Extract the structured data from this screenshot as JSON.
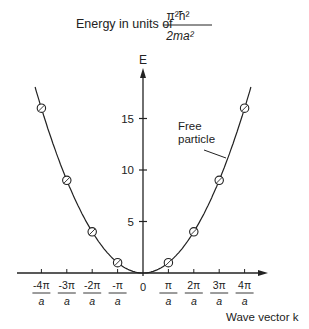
{
  "title": {
    "prefix": "Energy in units of",
    "numerator": "π²ħ²",
    "denominator": "2ma²"
  },
  "axes": {
    "y_label": "E",
    "x_label": "Wave vector k"
  },
  "annotation": {
    "line1": "Free",
    "line2": "particle"
  },
  "chart_data": {
    "type": "line",
    "xlabel": "Wave vector k",
    "ylabel": "E",
    "x_tick_labels": [
      {
        "num": "-4π",
        "den": "a"
      },
      {
        "num": "-3π",
        "den": "a"
      },
      {
        "num": "-2π",
        "den": "a"
      },
      {
        "num": "-π",
        "den": "a"
      },
      {
        "num": "0",
        "den": ""
      },
      {
        "num": "π",
        "den": "a"
      },
      {
        "num": "2π",
        "den": "a"
      },
      {
        "num": "3π",
        "den": "a"
      },
      {
        "num": "4π",
        "den": "a"
      }
    ],
    "y_ticks": [
      5,
      10,
      15
    ],
    "ylim": [
      0,
      19
    ],
    "xlim": [
      -4.2,
      4.6
    ],
    "series": [
      {
        "name": "Free particle",
        "curve": "E = n^2 (parabola)",
        "points": [
          {
            "k": -4,
            "E": 16
          },
          {
            "k": -3,
            "E": 9
          },
          {
            "k": -2,
            "E": 4
          },
          {
            "k": -1,
            "E": 1
          },
          {
            "k": 1,
            "E": 1
          },
          {
            "k": 2,
            "E": 4
          },
          {
            "k": 3,
            "E": 9
          },
          {
            "k": 4,
            "E": 16
          }
        ]
      }
    ],
    "grid": false,
    "legend": "annotation pointer to curve"
  }
}
